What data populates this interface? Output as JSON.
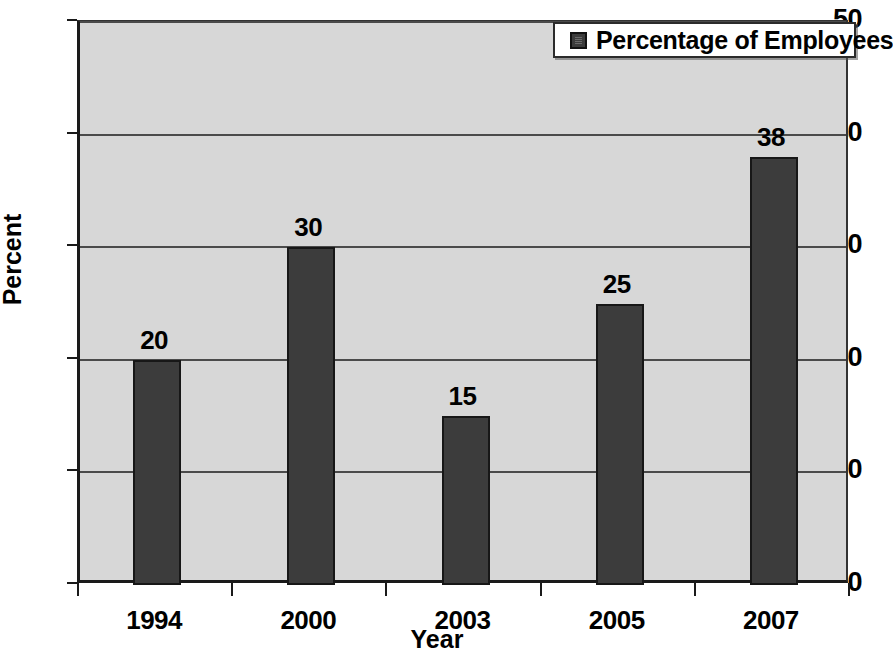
{
  "chart_data": {
    "type": "bar",
    "title": "",
    "categories": [
      "1994",
      "2000",
      "2003",
      "2005",
      "2007"
    ],
    "values": [
      20,
      30,
      15,
      25,
      38
    ],
    "series": [
      {
        "name": "Percentage of Employees",
        "values": [
          20,
          30,
          15,
          25,
          38
        ]
      }
    ],
    "data_labels": [
      "20",
      "30",
      "15",
      "25",
      "38"
    ],
    "xlabel": "Year",
    "ylabel": "Percent",
    "ylim": [
      0,
      50
    ],
    "yticks": [
      0,
      10,
      20,
      30,
      40,
      50
    ],
    "ytick_labels": [
      "0",
      "10",
      "20",
      "30",
      "40",
      "50"
    ],
    "grid": true,
    "legend_position": "top-right",
    "legend_entries": [
      "Percentage of Employees"
    ],
    "colors": {
      "bar_fill": "#3c3c3c",
      "bar_border": "#171717",
      "plot_background": "#d7d7d7",
      "gridline": "#4a4a4a",
      "axis": "#1a1a1a",
      "text": "#000000",
      "legend_background": "#ffffff"
    }
  },
  "legend": {
    "label": "Percentage of Employees",
    "swatch_name": "legend-color-swatch"
  },
  "axes": {
    "y_title": "Percent",
    "x_title": "Year"
  }
}
